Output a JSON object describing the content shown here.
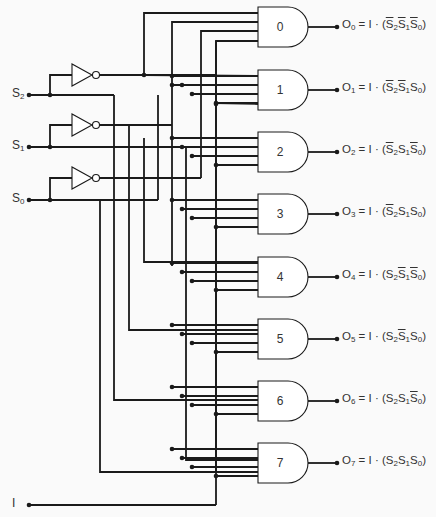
{
  "diagram": {
    "type": "3-to-8 decoder / 1-to-8 demultiplexer logic circuit",
    "inputs": [
      {
        "id": "S2",
        "label": "S",
        "sub": "2",
        "y": 95
      },
      {
        "id": "S1",
        "label": "S",
        "sub": "1",
        "y": 147
      },
      {
        "id": "S0",
        "label": "S",
        "sub": "0",
        "y": 200
      },
      {
        "id": "I",
        "label": "I",
        "sub": "",
        "y": 505
      }
    ],
    "gates": [
      {
        "label": "0",
        "output": "O",
        "sub": "0",
        "terms": [
          {
            "s": "S",
            "n": "2",
            "bar": true
          },
          {
            "s": "S",
            "n": "1",
            "bar": true
          },
          {
            "s": "S",
            "n": "0",
            "bar": true
          }
        ]
      },
      {
        "label": "1",
        "output": "O",
        "sub": "1",
        "terms": [
          {
            "s": "S",
            "n": "2",
            "bar": true
          },
          {
            "s": "S",
            "n": "1",
            "bar": true
          },
          {
            "s": "S",
            "n": "0",
            "bar": false
          }
        ]
      },
      {
        "label": "2",
        "output": "O",
        "sub": "2",
        "terms": [
          {
            "s": "S",
            "n": "2",
            "bar": true
          },
          {
            "s": "S",
            "n": "1",
            "bar": false
          },
          {
            "s": "S",
            "n": "0",
            "bar": true
          }
        ]
      },
      {
        "label": "3",
        "output": "O",
        "sub": "3",
        "terms": [
          {
            "s": "S",
            "n": "2",
            "bar": true
          },
          {
            "s": "S",
            "n": "1",
            "bar": false
          },
          {
            "s": "S",
            "n": "0",
            "bar": false
          }
        ]
      },
      {
        "label": "4",
        "output": "O",
        "sub": "4",
        "terms": [
          {
            "s": "S",
            "n": "2",
            "bar": false
          },
          {
            "s": "S",
            "n": "1",
            "bar": true
          },
          {
            "s": "S",
            "n": "0",
            "bar": true
          }
        ]
      },
      {
        "label": "5",
        "output": "O",
        "sub": "5",
        "terms": [
          {
            "s": "S",
            "n": "2",
            "bar": false
          },
          {
            "s": "S",
            "n": "1",
            "bar": true
          },
          {
            "s": "S",
            "n": "0",
            "bar": false
          }
        ]
      },
      {
        "label": "6",
        "output": "O",
        "sub": "6",
        "terms": [
          {
            "s": "S",
            "n": "2",
            "bar": false
          },
          {
            "s": "S",
            "n": "1",
            "bar": false
          },
          {
            "s": "S",
            "n": "0",
            "bar": true
          }
        ]
      },
      {
        "label": "7",
        "output": "O",
        "sub": "7",
        "terms": [
          {
            "s": "S",
            "n": "2",
            "bar": false
          },
          {
            "s": "S",
            "n": "1",
            "bar": false
          },
          {
            "s": "S",
            "n": "0",
            "bar": false
          }
        ]
      }
    ],
    "equation": {
      "eq": "=",
      "I": "I",
      "dot": "·",
      "open": "(",
      "close": ")"
    }
  }
}
